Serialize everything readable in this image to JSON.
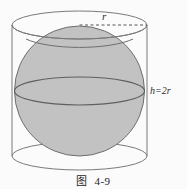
{
  "figure": {
    "caption": "图  4-9",
    "caption_number": "4-9",
    "caption_prefix": "图",
    "background_color": "#fbfbfb",
    "labels": {
      "radius": "r",
      "height": "h=2r"
    },
    "colors": {
      "sphere_fill": "#c2c2c2",
      "sphere_stroke": "#6e6e6e",
      "cylinder_stroke": "#7a7a7a",
      "dashed_line": "#555555",
      "text": "#2b2b2b"
    },
    "geometry": {
      "cylinder": {
        "left_x": 12,
        "right_x": 147,
        "top_ellipse_cy": 25,
        "bottom_ellipse_cy": 156,
        "ellipse_rx": 67.5,
        "ellipse_ry": 14
      },
      "sphere": {
        "cx": 79.5,
        "cy": 91,
        "r": 65,
        "equator_ry": 14
      },
      "radius_dashed_line": {
        "x1": 79.5,
        "y1": 25,
        "x2": 147,
        "y2": 25
      }
    }
  }
}
